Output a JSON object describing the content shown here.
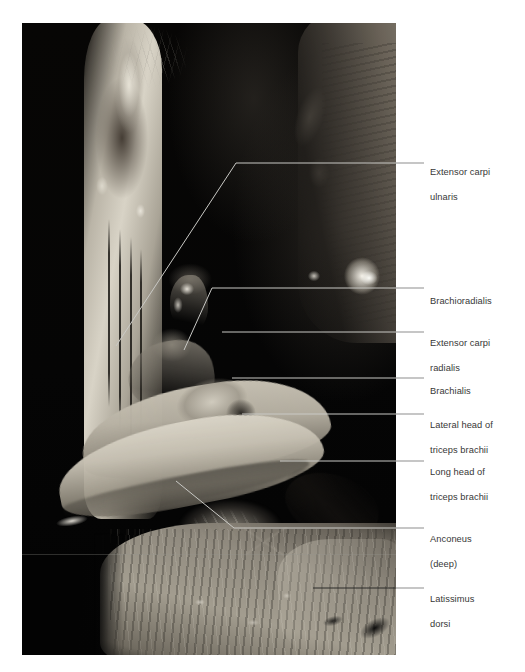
{
  "figure": {
    "kind": "anatomical-dissection-photograph",
    "region": "posterior arm and elbow, cadaveric dissection",
    "background_color": "#ffffff",
    "photo_background_color": "#050505",
    "leader_line_color_on_photo": "#c8c8c4",
    "leader_line_color_on_white": "#8d8d8d",
    "label_text_color": "#373737"
  },
  "labels": [
    {
      "id": "extensor-carpi-ulnaris",
      "text": "Extensor carpi\nulnaris",
      "line1": "Extensor carpi",
      "line2": "ulnaris",
      "leader_y": 163,
      "text_top": 153
    },
    {
      "id": "brachioradialis",
      "text": "Brachioradialis",
      "line1": "Brachioradialis",
      "line2": "",
      "leader_y": 288,
      "text_top": 282
    },
    {
      "id": "extensor-carpi-radialis",
      "text": "Extensor carpi\nradialis",
      "line1": "Extensor carpi",
      "line2": "radialis",
      "leader_y": 332,
      "text_top": 324
    },
    {
      "id": "brachialis",
      "text": "Brachialis",
      "line1": "Brachialis",
      "line2": "",
      "leader_y": 378,
      "text_top": 372
    },
    {
      "id": "lateral-head-of-triceps-brachii",
      "text": "Lateral head of\ntriceps brachii",
      "line1": "Lateral head of",
      "line2": "triceps brachii",
      "leader_y": 414,
      "text_top": 406
    },
    {
      "id": "long-head-of-triceps-brachii",
      "text": "Long head of\ntriceps brachii",
      "line1": "Long head of",
      "line2": "triceps brachii",
      "leader_y": 460,
      "text_top": 452
    },
    {
      "id": "anconeus-deep",
      "text": "Anconeus\n(deep)",
      "line1": "Anconeus",
      "line2": "(deep)",
      "leader_y": 528,
      "text_top": 520
    },
    {
      "id": "latissimus-dorsi",
      "text": "Latissimus\ndorsi",
      "line1": "Latissimus",
      "line2": "dorsi",
      "leader_y": 588,
      "text_top": 580
    }
  ]
}
